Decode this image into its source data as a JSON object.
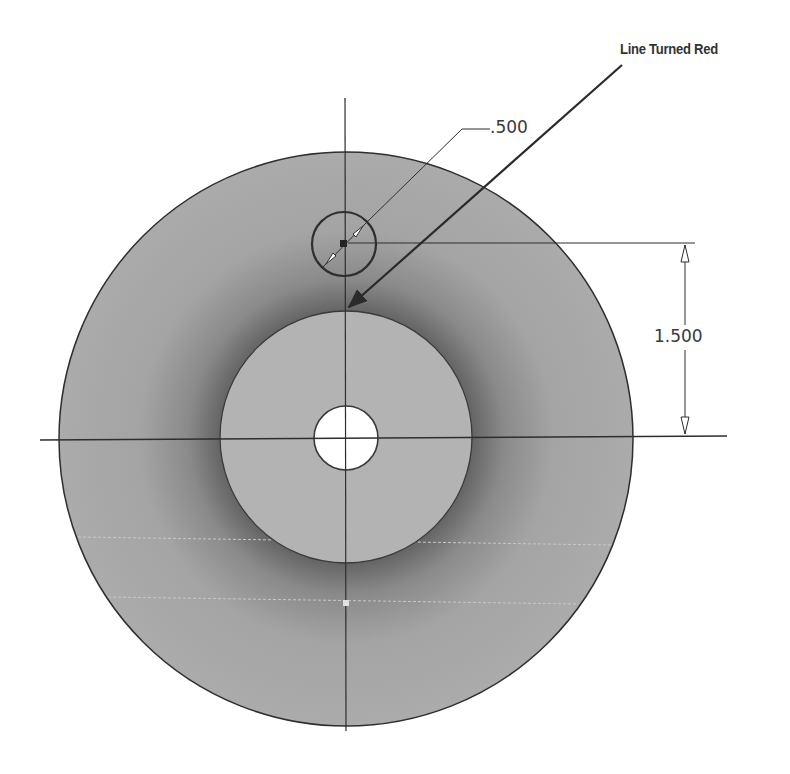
{
  "drawing": {
    "callout": {
      "label": "Line Turned Red",
      "arrow_from": [
        622,
        65
      ],
      "arrow_to": [
        347,
        309
      ]
    },
    "dimensions": {
      "diameter": {
        "label": ".500",
        "target": "small-hole"
      },
      "vertical": {
        "label": "1.500",
        "from": "small-hole-center",
        "to": "part-center"
      }
    },
    "geometry": {
      "outer_disc": {
        "cx": 346,
        "cy": 439,
        "r": 287
      },
      "inner_boss": {
        "cx": 346,
        "cy": 437,
        "r": 126
      },
      "center_hole": {
        "cx": 346,
        "cy": 438,
        "r": 32
      },
      "small_hole": {
        "cx": 344,
        "cy": 244,
        "r": 32
      }
    },
    "colors": {
      "outer_fill": "#a8a8a8",
      "inner_fill": "#b4b4b4",
      "shadow": "#6e6e6e",
      "line": "#2e2e2e",
      "hole_fill": "#ffffff"
    }
  }
}
